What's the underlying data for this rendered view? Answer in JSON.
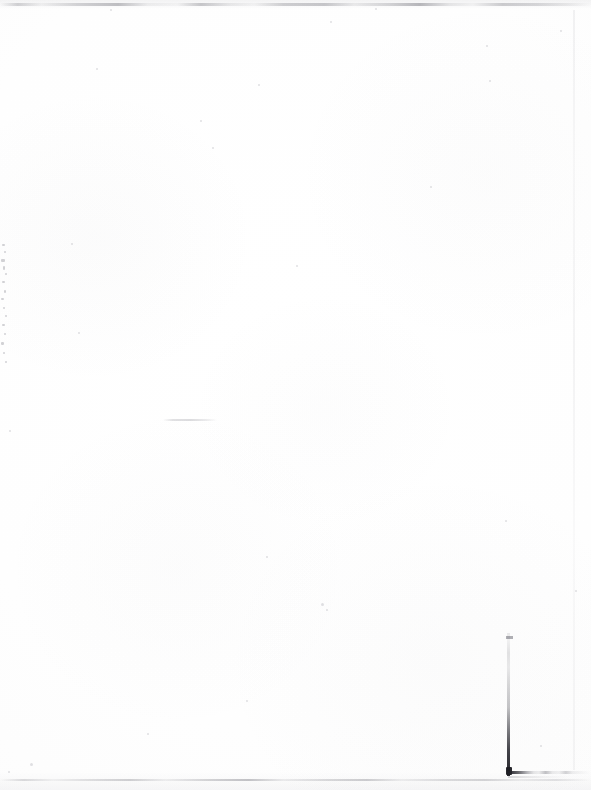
{
  "page": {
    "kind": "scanned-blank-page",
    "width": 591,
    "height": 790,
    "background_color": "#fdfdfd",
    "visible_text": "",
    "text_content_present": false
  },
  "colors": {
    "paper": "#fdfdfd",
    "paper_highlight": "#ffffff",
    "paper_shade": "#fafafa",
    "scan_line": "#78787f",
    "mark_dark": "#1e1e24",
    "speckle": "#6e6e78"
  },
  "artifacts": {
    "top_scan_line": {
      "label": "top scanner edge line",
      "y": 3,
      "style": "broken dashed grey"
    },
    "bottom_scan_line": {
      "label": "bottom scanner edge line",
      "y": 779,
      "style": "broken dashed grey"
    },
    "right_page_edge": {
      "label": "faint right page edge",
      "x": 573
    },
    "mid_page_smudge": {
      "label": "faint horizontal smudge",
      "x": 163,
      "y": 419,
      "width": 54
    },
    "corner_mark": {
      "label": "dark L-shaped corner mark",
      "vertical_x": 507,
      "vertical_top_y": 636,
      "vertical_bottom_y": 775,
      "horizontal_y": 773,
      "horizontal_extent_x": 565
    },
    "left_edge_speckles": {
      "label": "speckle column along left margin",
      "x": 0,
      "y_start": 240,
      "y_end": 370,
      "dots": [
        {
          "x": 2,
          "y": 4,
          "w": 3,
          "h": 2
        },
        {
          "x": 4,
          "y": 11,
          "w": 2,
          "h": 2
        },
        {
          "x": 1,
          "y": 19,
          "w": 4,
          "h": 3
        },
        {
          "x": 3,
          "y": 26,
          "w": 2,
          "h": 4
        },
        {
          "x": 5,
          "y": 33,
          "w": 2,
          "h": 2
        },
        {
          "x": 2,
          "y": 41,
          "w": 3,
          "h": 2
        },
        {
          "x": 4,
          "y": 50,
          "w": 2,
          "h": 3
        },
        {
          "x": 1,
          "y": 58,
          "w": 3,
          "h": 2
        },
        {
          "x": 3,
          "y": 67,
          "w": 2,
          "h": 2
        },
        {
          "x": 5,
          "y": 75,
          "w": 2,
          "h": 2
        },
        {
          "x": 2,
          "y": 84,
          "w": 3,
          "h": 2
        },
        {
          "x": 4,
          "y": 93,
          "w": 2,
          "h": 2
        },
        {
          "x": 1,
          "y": 102,
          "w": 3,
          "h": 3
        },
        {
          "x": 3,
          "y": 112,
          "w": 2,
          "h": 2
        },
        {
          "x": 5,
          "y": 121,
          "w": 2,
          "h": 2
        }
      ]
    },
    "dust_specks": [
      {
        "x": 110,
        "y": 9,
        "d": 2
      },
      {
        "x": 375,
        "y": 8,
        "d": 2
      },
      {
        "x": 330,
        "y": 21,
        "d": 2
      },
      {
        "x": 96,
        "y": 68,
        "d": 2
      },
      {
        "x": 486,
        "y": 45,
        "d": 2
      },
      {
        "x": 560,
        "y": 30,
        "d": 2
      },
      {
        "x": 71,
        "y": 243,
        "d": 2
      },
      {
        "x": 200,
        "y": 120,
        "d": 2
      },
      {
        "x": 258,
        "y": 84,
        "d": 2
      },
      {
        "x": 430,
        "y": 186,
        "d": 2
      },
      {
        "x": 489,
        "y": 80,
        "d": 2
      },
      {
        "x": 212,
        "y": 147,
        "d": 2
      },
      {
        "x": 78,
        "y": 332,
        "d": 2
      },
      {
        "x": 296,
        "y": 265,
        "d": 2
      },
      {
        "x": 505,
        "y": 520,
        "d": 2
      },
      {
        "x": 321,
        "y": 603,
        "d": 3
      },
      {
        "x": 326,
        "y": 609,
        "d": 2
      },
      {
        "x": 266,
        "y": 556,
        "d": 2
      },
      {
        "x": 9,
        "y": 430,
        "d": 2
      },
      {
        "x": 147,
        "y": 733,
        "d": 2
      },
      {
        "x": 30,
        "y": 763,
        "d": 3
      },
      {
        "x": 8,
        "y": 771,
        "d": 2
      },
      {
        "x": 575,
        "y": 590,
        "d": 2
      },
      {
        "x": 540,
        "y": 745,
        "d": 2
      },
      {
        "x": 246,
        "y": 700,
        "d": 2
      }
    ]
  }
}
